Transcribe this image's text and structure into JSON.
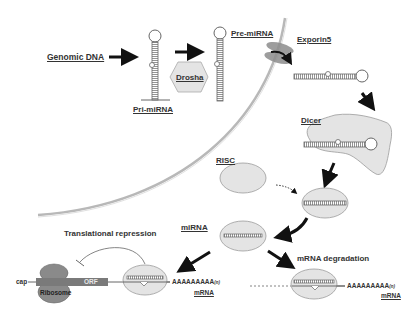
{
  "diagram": {
    "colors": {
      "text": "#333333",
      "arrow": "#111111",
      "protein_fill": "#e4e4e4",
      "protein_stroke": "#9a9a9a",
      "membrane": "#b8b8b8",
      "exportin": "#8c8c8c",
      "ribosome": "#8a8a8a",
      "orf_bar": "#7a7a7a",
      "rna_strand": "#666666"
    },
    "labels": {
      "genomic_dna": "Genomic DNA",
      "pri_mirna": "Pri-miRNA",
      "drosha": "Drosha",
      "pre_mirna": "Pre-miRNA",
      "exportin5": "Exporin5",
      "dicer": "Dicer",
      "risc": "RISC",
      "mirna": "miRNA",
      "translational_repression": "Translational repression",
      "mrna_degradation": "mRNA degradation",
      "cap": "cap",
      "orf": "ORF",
      "ribosome": "Ribosome",
      "poly_a_left": "AAAAAAAAA",
      "poly_a_left_suffix": "(n)",
      "mrna_left": "mRNA",
      "poly_a_right": "AAAAAAAAA",
      "poly_a_right_suffix": "(n)",
      "mrna_right": "mRNA"
    },
    "nodes": [
      {
        "id": "genomic_dna",
        "label": "Genomic DNA"
      },
      {
        "id": "pri_mirna",
        "label": "Pri-miRNA"
      },
      {
        "id": "drosha",
        "label": "Drosha"
      },
      {
        "id": "pre_mirna",
        "label": "Pre-miRNA"
      },
      {
        "id": "exportin5",
        "label": "Exporin5"
      },
      {
        "id": "dicer",
        "label": "Dicer"
      },
      {
        "id": "risc",
        "label": "RISC"
      },
      {
        "id": "mirna",
        "label": "miRNA"
      },
      {
        "id": "translational_repression",
        "label": "Translational repression"
      },
      {
        "id": "mrna_degradation",
        "label": "mRNA degradation"
      }
    ],
    "edges": [
      {
        "from": "genomic_dna",
        "to": "pri_mirna"
      },
      {
        "from": "pri_mirna",
        "to": "pre_mirna",
        "via": "drosha"
      },
      {
        "from": "pre_mirna",
        "to": "exportin5"
      },
      {
        "from": "exportin5",
        "to": "dicer"
      },
      {
        "from": "dicer",
        "to": "risc_complex"
      },
      {
        "from": "risc",
        "to": "risc_complex",
        "style": "dotted"
      },
      {
        "from": "risc_complex",
        "to": "mirna"
      },
      {
        "from": "mirna",
        "to": "translational_repression"
      },
      {
        "from": "mirna",
        "to": "mrna_degradation"
      }
    ]
  }
}
